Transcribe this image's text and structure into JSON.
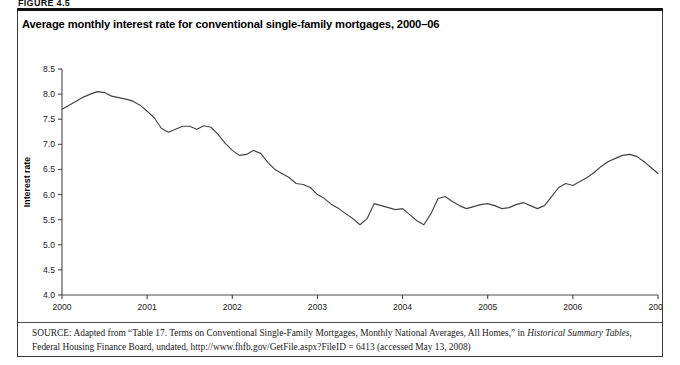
{
  "figure": {
    "label": "FIGURE 4.5",
    "title": "Average monthly interest rate for conventional single-family mortgages, 2000–06"
  },
  "source": {
    "prefix": "SOURCE:",
    "text_part1": " Adapted from “Table 17. Terms on Conventional Single-Family Mortgages, Monthly National Averages, All Homes,” in ",
    "italic1": "Historical Summary Tables",
    "text_part2": ", Federal Housing Finance Board, undated, http://www.fhfb.gov/GetFile.aspx?FileID = 6413 (accessed May 13, 2008)"
  },
  "chart_data": {
    "type": "line",
    "title": "Average monthly interest rate for conventional single-family mortgages, 2000–06",
    "xlabel": "Year",
    "ylabel": "Interest rate",
    "xlim": [
      2000,
      2007
    ],
    "ylim": [
      4.0,
      8.5
    ],
    "grid": false,
    "legend": "none",
    "xticks": [
      "2000",
      "2001",
      "2002",
      "2003",
      "2004",
      "2005",
      "2006",
      "2007"
    ],
    "xtick_values": [
      2000,
      2001,
      2002,
      2003,
      2004,
      2005,
      2006,
      2007
    ],
    "yticks": [
      "4.0",
      "4.5",
      "5.0",
      "5.5",
      "6.0",
      "6.5",
      "7.0",
      "7.5",
      "8.0",
      "8.5"
    ],
    "ytick_values": [
      4.0,
      4.5,
      5.0,
      5.5,
      6.0,
      6.5,
      7.0,
      7.5,
      8.0,
      8.5
    ],
    "series": [
      {
        "name": "Interest rate",
        "color": "#444444",
        "x": [
          2000.0,
          2000.083,
          2000.167,
          2000.25,
          2000.333,
          2000.417,
          2000.5,
          2000.583,
          2000.667,
          2000.75,
          2000.833,
          2000.917,
          2001.0,
          2001.083,
          2001.167,
          2001.25,
          2001.333,
          2001.417,
          2001.5,
          2001.583,
          2001.667,
          2001.75,
          2001.833,
          2001.917,
          2002.0,
          2002.083,
          2002.167,
          2002.25,
          2002.333,
          2002.417,
          2002.5,
          2002.583,
          2002.667,
          2002.75,
          2002.833,
          2002.917,
          2003.0,
          2003.083,
          2003.167,
          2003.25,
          2003.333,
          2003.417,
          2003.5,
          2003.583,
          2003.667,
          2003.75,
          2003.833,
          2003.917,
          2004.0,
          2004.083,
          2004.167,
          2004.25,
          2004.333,
          2004.417,
          2004.5,
          2004.583,
          2004.667,
          2004.75,
          2004.833,
          2004.917,
          2005.0,
          2005.083,
          2005.167,
          2005.25,
          2005.333,
          2005.417,
          2005.5,
          2005.583,
          2005.667,
          2005.75,
          2005.833,
          2005.917,
          2006.0,
          2006.083,
          2006.167,
          2006.25,
          2006.333,
          2006.417,
          2006.5,
          2006.583,
          2006.667,
          2006.75,
          2006.833,
          2006.917,
          2007.0
        ],
        "y": [
          7.7,
          7.78,
          7.86,
          7.94,
          8.0,
          8.05,
          8.03,
          7.96,
          7.93,
          7.9,
          7.86,
          7.78,
          7.66,
          7.53,
          7.32,
          7.24,
          7.3,
          7.36,
          7.36,
          7.3,
          7.37,
          7.34,
          7.2,
          7.02,
          6.88,
          6.78,
          6.8,
          6.88,
          6.82,
          6.64,
          6.5,
          6.42,
          6.34,
          6.22,
          6.2,
          6.14,
          6.0,
          5.92,
          5.8,
          5.72,
          5.62,
          5.52,
          5.4,
          5.52,
          5.82,
          5.78,
          5.74,
          5.7,
          5.72,
          5.6,
          5.48,
          5.4,
          5.62,
          5.92,
          5.96,
          5.86,
          5.78,
          5.72,
          5.76,
          5.8,
          5.82,
          5.78,
          5.72,
          5.74,
          5.8,
          5.84,
          5.78,
          5.72,
          5.78,
          5.96,
          6.14,
          6.22,
          6.18,
          6.26,
          6.34,
          6.44,
          6.56,
          6.66,
          6.72,
          6.78,
          6.8,
          6.76,
          6.66,
          6.54,
          6.42
        ]
      }
    ]
  }
}
